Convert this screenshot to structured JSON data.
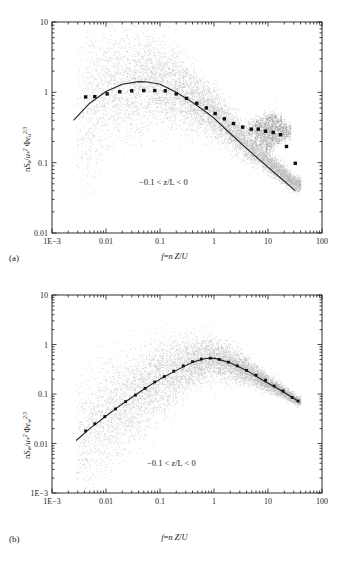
{
  "figure": {
    "background": "#ffffff",
    "ink": "#1a1a1a",
    "scatter_color": "#b9b9b9",
    "marker_color": "#111111",
    "curve_color": "#222222"
  },
  "panels": [
    {
      "tag": "(a)",
      "ylabel_plain": "n S_u / u_*^2 Φε_u^(2/3)",
      "ylabel_parts": {
        "n": "n",
        "S": "S",
        "S_sub": "u",
        "slash": "/",
        "u": "u",
        "u_sub": "*",
        "u_sup": "2",
        "phi": "Φ",
        "eps": "ε",
        "eps_sub": "u",
        "eps_sup": "2/3"
      },
      "xlabel_parts": {
        "f": "f",
        "eq": "=",
        "n": "n",
        "Z": "Z",
        "slash": "/",
        "U": "U"
      },
      "annotation": "−0.1 < z/L < 0",
      "y_ticks": [
        "10",
        "1",
        "0.1",
        "0.01"
      ],
      "x_ticks": [
        "1E−3",
        "0.01",
        "0.1",
        "1",
        "10",
        "100"
      ]
    },
    {
      "tag": "(b)",
      "ylabel_plain": "n S_w / u_*^2 Φε_w^(2/3)",
      "ylabel_parts": {
        "n": "n",
        "S": "S",
        "S_sub": "w",
        "slash": "/",
        "u": "u",
        "u_sub": "*",
        "u_sup": "2",
        "phi": "Φ",
        "eps": "ε",
        "eps_sub": "w",
        "eps_sup": "2/3"
      },
      "xlabel_parts": {
        "f": "f",
        "eq": "=",
        "n": "n",
        "Z": "Z",
        "slash": "/",
        "U": "U"
      },
      "annotation": "−0.1 < z/L < 0",
      "y_ticks": [
        "10",
        "1",
        "0.1",
        "0.01",
        "1E−3"
      ],
      "x_ticks": [
        "1E−3",
        "0.01",
        "0.1",
        "1",
        "10",
        "100"
      ]
    }
  ],
  "chart_data": [
    {
      "type": "scatter",
      "panel": "a",
      "title": "",
      "xlabel": "f = nZ/U",
      "ylabel": "n Su / u*² Φεu^(2/3)",
      "xscale": "log",
      "yscale": "log",
      "xlim": [
        0.001,
        100
      ],
      "ylim": [
        0.01,
        10
      ],
      "grid": false,
      "legend": false,
      "annotations": [
        "−0.1 < z/L < 0"
      ],
      "series": [
        {
          "name": "bin-mean markers",
          "style": "filled-square-markers",
          "x": [
            0.0042,
            0.0062,
            0.0105,
            0.018,
            0.03,
            0.05,
            0.08,
            0.125,
            0.2,
            0.31,
            0.48,
            0.72,
            1.05,
            1.55,
            2.3,
            3.4,
            4.9,
            6.6,
            9.0,
            12.5,
            17.0,
            22.0,
            32.0
          ],
          "y": [
            0.86,
            0.87,
            0.95,
            1.02,
            1.05,
            1.06,
            1.06,
            1.05,
            0.95,
            0.82,
            0.7,
            0.6,
            0.5,
            0.42,
            0.36,
            0.32,
            0.3,
            0.3,
            0.28,
            0.27,
            0.25,
            0.17,
            0.098
          ]
        },
        {
          "name": "model curve",
          "style": "solid-line",
          "x": [
            0.0025,
            0.005,
            0.01,
            0.02,
            0.04,
            0.06,
            0.1,
            0.2,
            0.4,
            0.7,
            1.0,
            2.0,
            4.0,
            8.0,
            16.0,
            32.0
          ],
          "y": [
            0.4,
            0.7,
            1.03,
            1.3,
            1.42,
            1.4,
            1.3,
            1.0,
            0.72,
            0.53,
            0.43,
            0.26,
            0.16,
            0.1,
            0.063,
            0.04
          ]
        },
        {
          "name": "raw spectra cloud",
          "style": "dense-gray-point-cloud",
          "x_range": [
            0.0027,
            40
          ],
          "y_range": [
            0.012,
            8
          ],
          "description": "Dense light-gray scatter of individual run spectra, broadest spread at low f, narrowing along the −2/3 slope at high f, with several upward-veering filament streaks near f = 5–30."
        }
      ]
    },
    {
      "type": "scatter",
      "panel": "b",
      "title": "",
      "xlabel": "f = nZ/U",
      "ylabel": "n Sw / u*² Φεw^(2/3)",
      "xscale": "log",
      "yscale": "log",
      "xlim": [
        0.001,
        100
      ],
      "ylim": [
        0.001,
        10
      ],
      "grid": false,
      "legend": false,
      "annotations": [
        "−0.1 < z/L < 0"
      ],
      "series": [
        {
          "name": "bin-mean markers",
          "style": "filled-square-markers",
          "x": [
            0.0042,
            0.0062,
            0.0095,
            0.015,
            0.023,
            0.035,
            0.053,
            0.08,
            0.12,
            0.18,
            0.27,
            0.4,
            0.58,
            0.85,
            1.25,
            1.85,
            2.7,
            4.0,
            6.0,
            9.0,
            13.0,
            19.0,
            28.0,
            36.0
          ],
          "y": [
            0.018,
            0.025,
            0.035,
            0.05,
            0.07,
            0.095,
            0.13,
            0.175,
            0.225,
            0.29,
            0.37,
            0.45,
            0.51,
            0.53,
            0.5,
            0.44,
            0.37,
            0.3,
            0.24,
            0.19,
            0.145,
            0.115,
            0.085,
            0.072
          ]
        },
        {
          "name": "model curve",
          "style": "solid-line",
          "x": [
            0.0028,
            0.005,
            0.01,
            0.02,
            0.05,
            0.1,
            0.2,
            0.4,
            0.7,
            1.0,
            2.0,
            4.0,
            8.0,
            16.0,
            36.0
          ],
          "y": [
            0.0115,
            0.02,
            0.036,
            0.063,
            0.125,
            0.2,
            0.3,
            0.44,
            0.52,
            0.53,
            0.43,
            0.3,
            0.19,
            0.125,
            0.072
          ]
        },
        {
          "name": "raw spectra cloud",
          "style": "dense-gray-point-cloud",
          "x_range": [
            0.0027,
            40
          ],
          "y_range": [
            0.0015,
            1.2
          ],
          "description": "Dense light-gray scatter of individual run spectra following the curve, widest vertical spread below f = 0.05 reaching down to 1E−3, collapsing tightly onto the curve for f > 1."
        }
      ]
    }
  ]
}
